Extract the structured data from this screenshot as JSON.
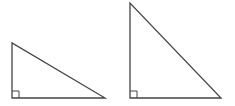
{
  "diagram": {
    "stroke_color": "#444444",
    "background": "#ffffff",
    "triangles": [
      {
        "name": "left-triangle",
        "vertices": [
          [
            12,
            43
          ],
          [
            12,
            98
          ],
          [
            105,
            98
          ]
        ],
        "right_angle_at": [
          12,
          98
        ],
        "right_angle_marker_size": 7
      },
      {
        "name": "right-triangle",
        "vertices": [
          [
            130,
            3
          ],
          [
            130,
            98
          ],
          [
            221,
            98
          ]
        ],
        "right_angle_at": [
          130,
          98
        ],
        "right_angle_marker_size": 7
      }
    ]
  }
}
